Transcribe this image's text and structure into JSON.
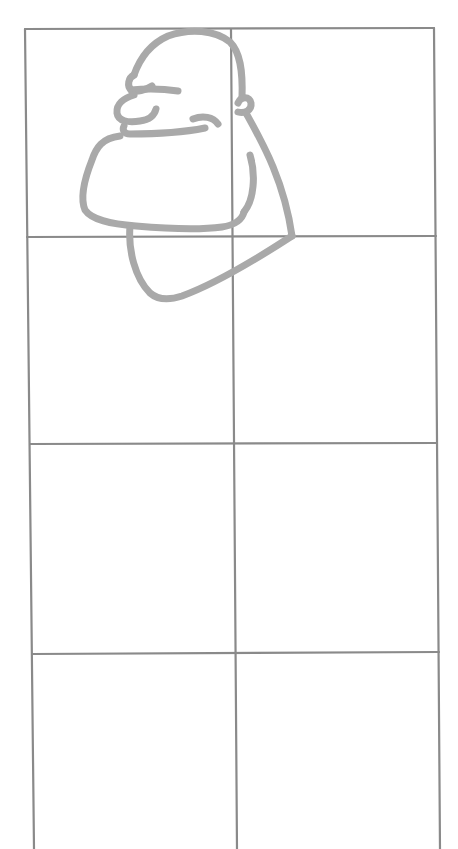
{
  "image": {
    "description": "Pencil drawing grid of 2 columns by 4 rows with a grey outline sketch of a cartoon bald man's head in profile occupying the top cells",
    "width": 458,
    "height": 849
  },
  "colors": {
    "background": "#ffffff",
    "grid_stroke": "#8a8a8a",
    "sketch_stroke": "#a9a9a9"
  },
  "grid": {
    "columns": 2,
    "rows": 4,
    "left_edge": {
      "top_x": 25,
      "bottom_x": 34
    },
    "middle_line": {
      "top_x": 231,
      "bottom_x": 237
    },
    "right_edge": {
      "top_x": 434,
      "bottom_x": 440
    },
    "horizontal_lines_y": [
      28,
      236,
      444,
      653
    ]
  },
  "sketch": {
    "subject": "cartoon head in profile, facing left",
    "parts": [
      "cranium",
      "brow",
      "nose",
      "smile",
      "ear",
      "cheek",
      "jaw",
      "neck",
      "chin-underside"
    ]
  }
}
